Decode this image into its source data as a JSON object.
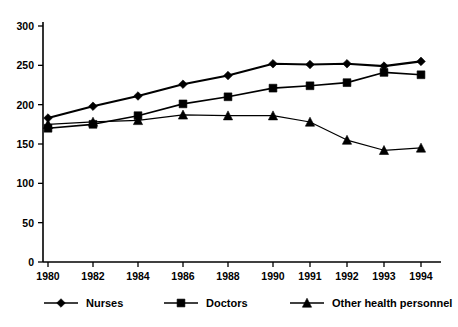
{
  "chart_data": {
    "type": "line",
    "title": "",
    "subtitle": "",
    "xlabel": "",
    "ylabel": "",
    "ylim": [
      0,
      300
    ],
    "yticks": [
      0,
      50,
      100,
      150,
      200,
      250,
      300
    ],
    "ytick_labels": [
      "0",
      "50",
      "100",
      "150",
      "200",
      "250",
      "300"
    ],
    "grid": false,
    "legend_position": "bottom",
    "x_axis_spacing": "categorical-uneven",
    "categories": [
      "1980",
      "1982",
      "1984",
      "1986",
      "1988",
      "1990",
      "1991",
      "1992",
      "1993",
      "1994"
    ],
    "x": [
      1980,
      1982,
      1984,
      1986,
      1988,
      1990,
      1991,
      1992,
      1993,
      1994
    ],
    "series": [
      {
        "name": "Nurses",
        "marker": "diamond",
        "values": [
          183,
          198,
          211,
          226,
          237,
          252,
          251,
          252,
          249,
          255
        ]
      },
      {
        "name": "Doctors",
        "marker": "square",
        "values": [
          170,
          175,
          186,
          201,
          210,
          221,
          224,
          228,
          241,
          238
        ]
      },
      {
        "name": "Other health personnel",
        "marker": "triangle",
        "values": [
          175,
          178,
          180,
          187,
          186,
          186,
          178,
          155,
          142,
          145
        ]
      }
    ]
  },
  "legend": {
    "items": [
      {
        "label": "Nurses",
        "marker": "diamond"
      },
      {
        "label": "Doctors",
        "marker": "square"
      },
      {
        "label": "Other health personnel",
        "marker": "triangle"
      }
    ]
  }
}
